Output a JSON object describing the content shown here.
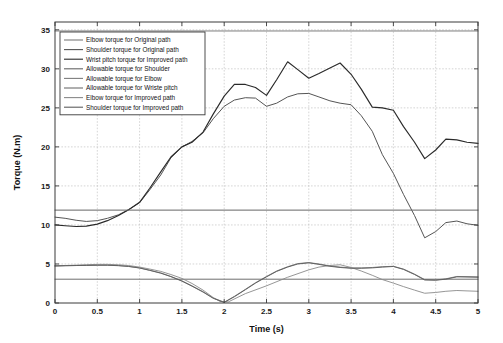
{
  "chart_data": {
    "type": "line",
    "title": "",
    "xlabel": "Time (s)",
    "ylabel": "Torque (N.m)",
    "xlim": [
      0,
      5
    ],
    "ylim": [
      0,
      36
    ],
    "xticks": [
      "0",
      "0.5",
      "1",
      "1.5",
      "2",
      "2.5",
      "3",
      "3.5",
      "4",
      "4.5",
      "5"
    ],
    "xtick_values": [
      0,
      0.5,
      1,
      1.5,
      2,
      2.5,
      3,
      3.5,
      4,
      4.5,
      5
    ],
    "yticks": [
      "0",
      "5",
      "10",
      "15",
      "20",
      "25",
      "30",
      "35"
    ],
    "ytick_values": [
      0,
      5,
      10,
      15,
      20,
      25,
      30,
      35
    ],
    "grid": true,
    "legend_position": "upper-left",
    "legend_entries": [
      "Elbow torque for Original path",
      "Shoulder torque for Original path",
      "Wrist pitch torque for Improved path",
      "Allowable torque for Shoulder",
      "Allowable torque for Elbow",
      "Allowable torque for Wriste pitch",
      "Elbow torque for Improved path",
      "Shoulder torque for Improved path"
    ],
    "series": [
      {
        "name": "Elbow torque for Original path",
        "color": "#7a7a7a",
        "width": 0.9,
        "x": [
          0,
          0.12,
          0.25,
          0.37,
          0.5,
          0.62,
          0.75,
          0.87,
          1.0,
          1.12,
          1.25,
          1.37,
          1.5,
          1.62,
          1.75,
          1.87,
          2.0,
          2.12,
          2.25,
          2.37,
          2.5,
          2.62,
          2.75,
          2.87,
          3.0,
          3.12,
          3.25,
          3.37,
          3.5,
          3.62,
          3.75,
          3.87,
          4.0,
          4.12,
          4.25,
          4.37,
          4.5,
          4.62,
          4.75,
          4.87,
          5.0
        ],
        "y": [
          4.75,
          4.78,
          4.8,
          4.82,
          4.85,
          4.85,
          4.8,
          4.7,
          4.5,
          4.2,
          3.85,
          3.4,
          2.85,
          2.2,
          1.45,
          0.65,
          0.1,
          0.85,
          1.75,
          2.6,
          3.4,
          4.1,
          4.65,
          5.05,
          5.18,
          5.0,
          4.75,
          4.6,
          4.5,
          4.5,
          4.55,
          4.65,
          4.7,
          4.35,
          3.7,
          3.0,
          2.95,
          3.1,
          3.4,
          3.38,
          3.35
        ]
      },
      {
        "name": "Shoulder torque for Original path",
        "color": "#555555",
        "width": 1.0,
        "x": [
          0,
          0.12,
          0.25,
          0.37,
          0.5,
          0.62,
          0.75,
          0.87,
          1.0,
          1.12,
          1.25,
          1.37,
          1.5,
          1.62,
          1.75,
          1.87,
          2.0,
          2.12,
          2.25,
          2.37,
          2.5,
          2.62,
          2.75,
          2.87,
          3.0,
          3.12,
          3.25,
          3.37,
          3.5,
          3.62,
          3.75,
          3.87,
          4.0,
          4.12,
          4.25,
          4.37,
          4.5,
          4.62,
          4.75,
          4.87,
          5.0
        ],
        "y": [
          11.0,
          10.85,
          10.6,
          10.45,
          10.55,
          10.85,
          11.3,
          11.95,
          12.85,
          14.5,
          16.4,
          18.6,
          20.0,
          20.7,
          21.8,
          23.6,
          25.2,
          26.0,
          26.3,
          26.25,
          25.2,
          25.6,
          26.4,
          26.8,
          26.85,
          26.4,
          25.9,
          25.6,
          25.4,
          24.0,
          22.0,
          19.0,
          16.6,
          13.9,
          11.2,
          8.35,
          9.15,
          10.3,
          10.5,
          10.15,
          9.95
        ]
      },
      {
        "name": "Wrist pitch torque for Improved path",
        "color": "#2a2a2a",
        "width": 1.15,
        "x": [
          0,
          0.12,
          0.25,
          0.37,
          0.5,
          0.62,
          0.75,
          0.87,
          1.0,
          1.12,
          1.25,
          1.37,
          1.5,
          1.62,
          1.75,
          1.87,
          2.0,
          2.12,
          2.25,
          2.37,
          2.5,
          2.62,
          2.75,
          2.87,
          3.0,
          3.12,
          3.25,
          3.37,
          3.5,
          3.62,
          3.75,
          3.87,
          4.0,
          4.12,
          4.25,
          4.37,
          4.5,
          4.62,
          4.75,
          4.87,
          5.0
        ],
        "y": [
          10.0,
          9.9,
          9.8,
          9.85,
          10.1,
          10.55,
          11.2,
          11.95,
          12.9,
          14.7,
          16.8,
          18.7,
          20.0,
          20.6,
          21.9,
          24.2,
          26.5,
          28.0,
          28.0,
          27.6,
          26.6,
          28.6,
          30.9,
          29.9,
          28.8,
          29.4,
          30.1,
          30.75,
          29.3,
          27.4,
          25.1,
          25.0,
          24.7,
          22.6,
          20.6,
          18.5,
          19.6,
          21.0,
          20.9,
          20.6,
          20.45
        ]
      },
      {
        "name": "Allowable torque for Shoulder",
        "color": "#666666",
        "width": 1.0,
        "constant": 11.9
      },
      {
        "name": "Allowable torque for Elbow",
        "color": "#7d7d7d",
        "width": 1.0,
        "constant": 34.85
      },
      {
        "name": "Allowable torque for Wriste pitch",
        "color": "#6d6d6d",
        "width": 1.0,
        "constant": 3.05
      },
      {
        "name": "Elbow torque for Improved path",
        "color": "#8a8a8a",
        "width": 0.9,
        "x": [
          0,
          0.12,
          0.25,
          0.37,
          0.5,
          0.62,
          0.75,
          0.87,
          1.0,
          1.12,
          1.25,
          1.37,
          1.5,
          1.62,
          1.75,
          1.87,
          1.95,
          2.05,
          2.25,
          2.5,
          2.75,
          3.0,
          3.12,
          3.25,
          3.37,
          3.5,
          3.62,
          3.75,
          3.87,
          4.0,
          4.12,
          4.25,
          4.37,
          4.5,
          4.62,
          4.75,
          4.87,
          5.0
        ],
        "y": [
          4.75,
          4.8,
          4.85,
          4.9,
          4.95,
          4.95,
          4.9,
          4.8,
          4.6,
          4.35,
          4.05,
          3.65,
          3.15,
          2.5,
          1.65,
          0.7,
          0.2,
          0.15,
          1.2,
          2.2,
          3.3,
          4.25,
          4.6,
          4.8,
          4.9,
          4.55,
          4.1,
          3.55,
          3.0,
          2.55,
          2.1,
          1.65,
          1.25,
          1.35,
          1.5,
          1.6,
          1.55,
          1.5
        ]
      },
      {
        "name": "Shoulder torque for Improved path",
        "color": "#5e5e5e",
        "width": 0.95,
        "x": [
          0,
          0.12,
          0.25,
          0.37,
          0.5,
          0.62,
          0.75,
          0.87,
          1.0,
          1.12,
          1.25,
          1.37,
          1.5,
          1.62,
          1.75,
          1.87,
          2.0,
          2.12,
          2.25,
          2.37,
          2.5,
          2.62,
          2.75,
          2.87,
          3.0,
          3.12,
          3.25,
          3.37,
          3.5,
          3.62,
          3.75,
          3.87,
          4.0,
          4.12,
          4.25,
          4.37,
          4.5,
          4.62,
          4.75,
          4.87,
          5.0
        ],
        "y": [
          4.75,
          4.78,
          4.8,
          4.82,
          4.84,
          4.84,
          4.78,
          4.68,
          4.48,
          4.18,
          3.82,
          3.38,
          2.8,
          2.15,
          1.4,
          0.6,
          0.08,
          0.8,
          1.7,
          2.55,
          3.35,
          4.05,
          4.6,
          5.0,
          5.15,
          4.95,
          4.7,
          4.55,
          4.45,
          4.45,
          4.5,
          4.6,
          4.68,
          4.3,
          3.65,
          2.95,
          2.92,
          3.05,
          3.35,
          3.33,
          3.3
        ]
      }
    ]
  },
  "axes": {
    "x_title": "Time (s)",
    "y_title": "Torque (N.m)"
  }
}
